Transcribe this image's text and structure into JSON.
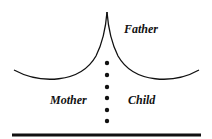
{
  "diagram": {
    "labels": {
      "father": "Father",
      "mother": "Mother",
      "child": "Child"
    },
    "dot_count": 6,
    "colors": {
      "stroke": "#111111",
      "background": "#ffffff"
    }
  }
}
